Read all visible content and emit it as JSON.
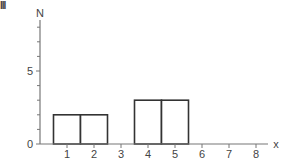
{
  "panel_label": "III",
  "chart_data": {
    "type": "bar",
    "title": "",
    "xlabel": "x",
    "ylabel": "N",
    "xlim": [
      0,
      8.4
    ],
    "ylim": [
      0,
      9
    ],
    "x_ticks": [
      "1",
      "2",
      "3",
      "4",
      "5",
      "6",
      "7",
      "8"
    ],
    "y_tick_labels": [
      {
        "value": 0,
        "label": "0"
      },
      {
        "value": 5,
        "label": "5"
      }
    ],
    "y_minor_ticks": [
      1,
      2,
      3,
      4,
      6,
      7,
      8
    ],
    "bars": [
      {
        "x": 1,
        "left": 0.5,
        "right": 1.5,
        "value": 2
      },
      {
        "x": 2,
        "left": 1.5,
        "right": 2.5,
        "value": 2
      },
      {
        "x": 4,
        "left": 3.5,
        "right": 4.5,
        "value": 3
      },
      {
        "x": 5,
        "left": 4.5,
        "right": 5.5,
        "value": 3
      }
    ],
    "categories": [
      "1",
      "2",
      "3",
      "4",
      "5",
      "6",
      "7",
      "8"
    ],
    "values": [
      2,
      2,
      0,
      3,
      3,
      0,
      0,
      0
    ],
    "grid": false,
    "legend": null
  },
  "colors": {
    "axis": "#777777",
    "bar_edge": "#333333",
    "bar_fill": "#ffffff"
  }
}
